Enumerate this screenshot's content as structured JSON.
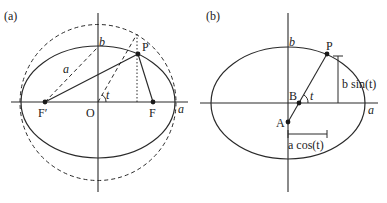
{
  "panel_a": {
    "label": "(a)",
    "labels": {
      "b": "b",
      "P": "P",
      "a_semi": "a",
      "t": "t",
      "F_prime": "F′",
      "O": "O",
      "F": "F",
      "a_axis": "a"
    }
  },
  "panel_b": {
    "label": "(b)",
    "labels": {
      "b": "b",
      "P": "P",
      "B": "B",
      "t": "t",
      "A": "A",
      "a_axis": "a",
      "b_sin": "b sin(t)",
      "a_cos": "a cos(t)"
    }
  },
  "colors": {
    "line": "#2a2a2a",
    "background": "#ffffff"
  }
}
